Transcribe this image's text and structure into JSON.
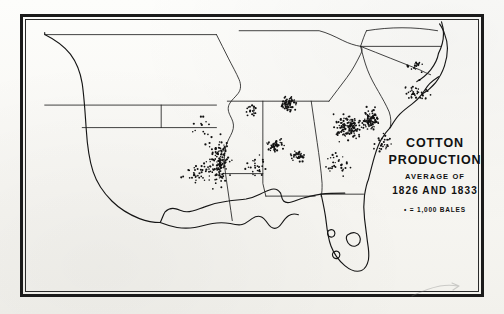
{
  "figure": {
    "kind": "dot-density-map",
    "region": "Southern United States",
    "background_color": "#fbfaf7",
    "ink_color": "#111111"
  },
  "legend": {
    "title_line_1": "COTTON",
    "title_line_2": "PRODUCTION",
    "subtitle": "AVERAGE OF",
    "years": "1826 AND 1833",
    "scale_note": "• = 1,000 BALES"
  },
  "chart_data": {
    "type": "scatter",
    "title": "COTTON PRODUCTION",
    "subtitle": "AVERAGE OF 1826 AND 1833",
    "dot_value": 1000,
    "dot_unit": "bales",
    "xlabel": "",
    "ylabel": "",
    "grid": false,
    "legend_position": "right",
    "clusters": [
      {
        "name": "Natchez District / Lower Mississippi Valley",
        "center": [
          197,
          148
        ],
        "dots": 150,
        "spread": [
          16,
          30
        ],
        "density": "very-high"
      },
      {
        "name": "Alabama Black Belt (west)",
        "center": [
          255,
          132
        ],
        "dots": 48,
        "spread": [
          11,
          9
        ],
        "density": "high"
      },
      {
        "name": "Alabama Black Belt (east)",
        "center": [
          277,
          142
        ],
        "dots": 34,
        "spread": [
          9,
          7
        ],
        "density": "high"
      },
      {
        "name": "Georgia Piedmont",
        "center": [
          330,
          113
        ],
        "dots": 130,
        "spread": [
          18,
          16
        ],
        "density": "very-high"
      },
      {
        "name": "Upper Savannah / South Carolina Piedmont",
        "center": [
          352,
          104
        ],
        "dots": 86,
        "spread": [
          13,
          13
        ],
        "density": "very-high"
      },
      {
        "name": "Tennessee Valley / North Alabama",
        "center": [
          268,
          88
        ],
        "dots": 62,
        "spread": [
          10,
          11
        ],
        "density": "high"
      },
      {
        "name": "Memphis / West Tennessee",
        "center": [
          232,
          96
        ],
        "dots": 20,
        "spread": [
          7,
          8
        ],
        "density": "medium"
      },
      {
        "name": "North Carolina Coastal Plain",
        "center": [
          400,
          78
        ],
        "dots": 40,
        "spread": [
          17,
          13
        ],
        "density": "medium"
      },
      {
        "name": "South Carolina Lowcountry",
        "center": [
          366,
          130
        ],
        "dots": 26,
        "spread": [
          12,
          11
        ],
        "density": "medium"
      },
      {
        "name": "Louisiana Red River",
        "center": [
          175,
          160
        ],
        "dots": 30,
        "spread": [
          16,
          12
        ],
        "density": "medium"
      },
      {
        "name": "Georgia Coastal Plain",
        "center": [
          318,
          150
        ],
        "dots": 30,
        "spread": [
          17,
          16
        ],
        "density": "low"
      },
      {
        "name": "Mississippi interior scatter",
        "center": [
          235,
          155
        ],
        "dots": 26,
        "spread": [
          18,
          17
        ],
        "density": "low"
      },
      {
        "name": "Virginia Southside",
        "center": [
          398,
          50
        ],
        "dots": 16,
        "spread": [
          14,
          8
        ],
        "density": "low"
      },
      {
        "name": "Arkansas scatter",
        "center": [
          180,
          110
        ],
        "dots": 12,
        "spread": [
          16,
          14
        ],
        "density": "sparse"
      }
    ]
  }
}
